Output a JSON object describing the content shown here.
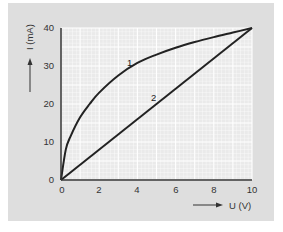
{
  "chart_data": {
    "type": "line",
    "title": "",
    "xlabel": "U (V)",
    "ylabel": "I (mA)",
    "xlim": [
      0,
      10
    ],
    "ylim": [
      0,
      40
    ],
    "x_ticks": [
      "0",
      "2",
      "4",
      "6",
      "8",
      "10"
    ],
    "y_ticks": [
      "0",
      "10",
      "20",
      "30",
      "40"
    ],
    "grid": true,
    "legend": "none (curves labeled inline)",
    "series": [
      {
        "name": "1",
        "x": [
          0,
          0.25,
          0.5,
          1,
          1.5,
          2,
          3,
          4,
          5,
          6,
          7,
          8,
          9,
          10
        ],
        "y": [
          0,
          8,
          11.5,
          16.5,
          20,
          23,
          27.5,
          30.8,
          33,
          34.8,
          36.3,
          37.6,
          38.8,
          40
        ]
      },
      {
        "name": "2",
        "x": [
          0,
          2,
          4,
          6,
          8,
          10
        ],
        "y": [
          0,
          8,
          16,
          24,
          32,
          40
        ]
      }
    ],
    "annotations": [
      {
        "text": "1",
        "x": 3.6,
        "y": 30.5
      },
      {
        "text": "2",
        "x": 4.9,
        "y": 21.5
      }
    ]
  },
  "labels": {
    "x_axis": "U (V)",
    "y_axis": "I (mA)",
    "curve1": "1",
    "curve2": "2",
    "x_ticks": [
      "0",
      "2",
      "4",
      "6",
      "8",
      "10"
    ],
    "y_ticks": [
      "0",
      "10",
      "20",
      "30",
      "40"
    ]
  },
  "colors": {
    "panel": "#dedede",
    "plot_bg": "#eeeeee",
    "grid_minor": "#ffffff",
    "grid_major": "#ffffff",
    "curve": "#222222",
    "axis": "#333333"
  }
}
